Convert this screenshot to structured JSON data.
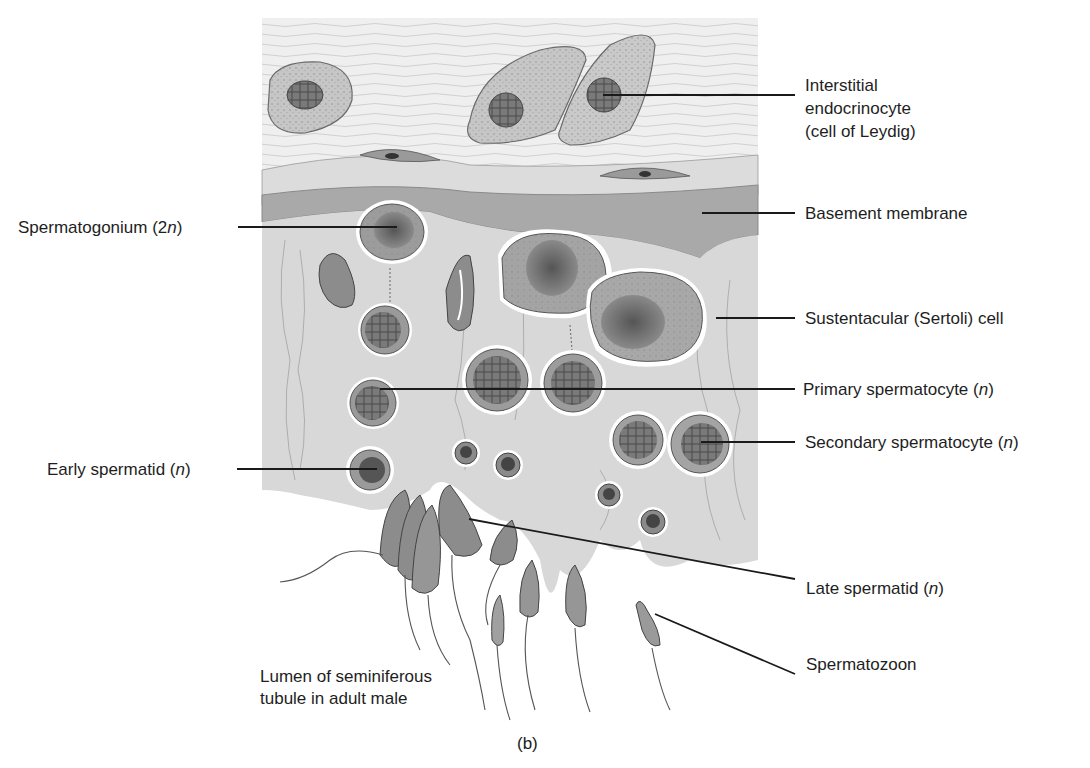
{
  "figure": {
    "panel_caption": "(b)",
    "labels_right": [
      {
        "id": "leydig",
        "lines": [
          "Interstitial",
          "endocrinocyte",
          "(cell of Leydig)"
        ]
      },
      {
        "id": "basement",
        "text": "Basement membrane"
      },
      {
        "id": "sertoli",
        "text": "Sustentacular (Sertoli) cell"
      },
      {
        "id": "primary",
        "text": "Primary spermatocyte ",
        "italic": "n"
      },
      {
        "id": "secondary",
        "text": "Secondary spermatocyte ",
        "italic": "n"
      },
      {
        "id": "late",
        "text": "Late spermatid ",
        "italic": "n"
      },
      {
        "id": "spermatozoon",
        "text": "Spermatozoon"
      }
    ],
    "labels_left": [
      {
        "id": "spermatogonium",
        "text": "Spermatogonium ",
        "prefix": "2",
        "italic": "n"
      },
      {
        "id": "early",
        "text": "Early spermatid ",
        "italic": "n"
      }
    ],
    "lumen_label": [
      "Lumen of seminiferous",
      "tubule in adult male"
    ],
    "colors": {
      "tissue": "#d9d9d9",
      "connective": "#ececec",
      "membrane": "#a9a9a9",
      "cytoplasm": "#bdbdbd",
      "nucleus": "#6e6e6e",
      "line": "#1a1a1a"
    }
  }
}
